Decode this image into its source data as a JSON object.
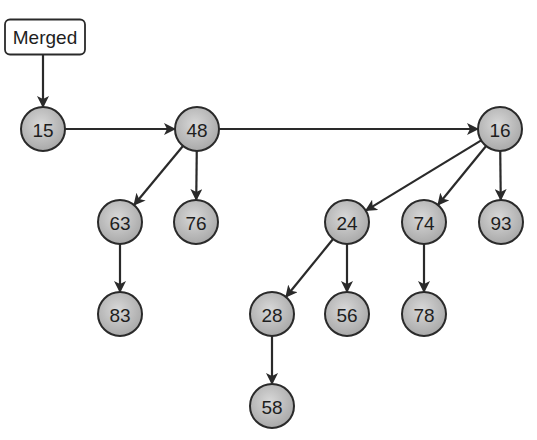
{
  "diagram": {
    "head": {
      "label": "Merged",
      "x": 45,
      "y": 37,
      "w": 80,
      "h": 35
    },
    "node_radius": 22,
    "colors": {
      "node_fill_center": "#d6d6d6",
      "node_fill_edge": "#a8a8a8",
      "stroke": "#2a2a2a",
      "text": "#1e1e1e"
    },
    "nodes": [
      {
        "id": "n15",
        "label": "15",
        "x": 43,
        "y": 129
      },
      {
        "id": "n48",
        "label": "48",
        "x": 197,
        "y": 129
      },
      {
        "id": "n16",
        "label": "16",
        "x": 500,
        "y": 129
      },
      {
        "id": "n63",
        "label": "63",
        "x": 120,
        "y": 222
      },
      {
        "id": "n76",
        "label": "76",
        "x": 196,
        "y": 222
      },
      {
        "id": "n24",
        "label": "24",
        "x": 347,
        "y": 222
      },
      {
        "id": "n74",
        "label": "74",
        "x": 424,
        "y": 222
      },
      {
        "id": "n93",
        "label": "93",
        "x": 501,
        "y": 222
      },
      {
        "id": "n83",
        "label": "83",
        "x": 120,
        "y": 314
      },
      {
        "id": "n28",
        "label": "28",
        "x": 272,
        "y": 314
      },
      {
        "id": "n56",
        "label": "56",
        "x": 347,
        "y": 314
      },
      {
        "id": "n78",
        "label": "78",
        "x": 424,
        "y": 314
      },
      {
        "id": "n58",
        "label": "58",
        "x": 272,
        "y": 406
      }
    ],
    "edges": [
      {
        "from": "head",
        "to": "n15"
      },
      {
        "from": "n15",
        "to": "n48"
      },
      {
        "from": "n48",
        "to": "n16"
      },
      {
        "from": "n48",
        "to": "n63"
      },
      {
        "from": "n48",
        "to": "n76"
      },
      {
        "from": "n63",
        "to": "n83"
      },
      {
        "from": "n16",
        "to": "n24"
      },
      {
        "from": "n16",
        "to": "n74"
      },
      {
        "from": "n16",
        "to": "n93"
      },
      {
        "from": "n24",
        "to": "n28"
      },
      {
        "from": "n24",
        "to": "n56"
      },
      {
        "from": "n74",
        "to": "n78"
      },
      {
        "from": "n28",
        "to": "n58"
      }
    ]
  }
}
